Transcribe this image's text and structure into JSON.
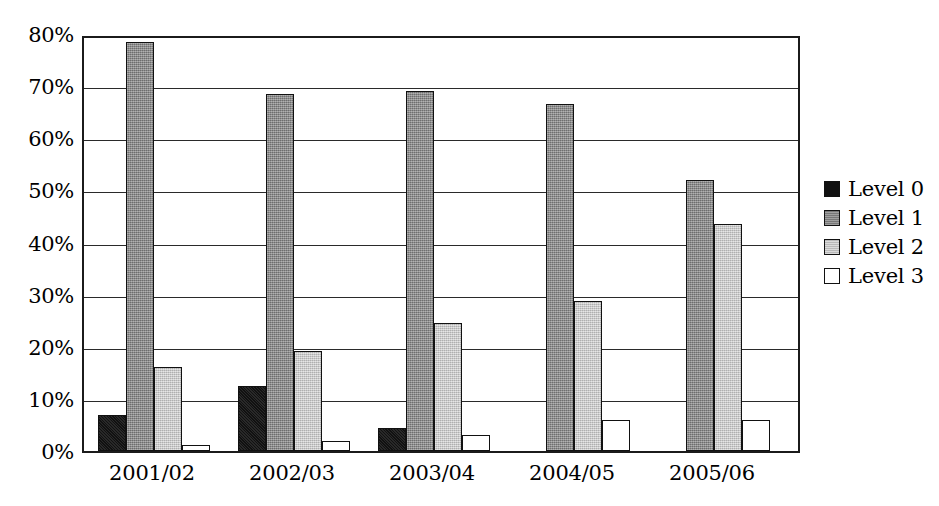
{
  "chart_data": {
    "type": "bar",
    "title": "",
    "subtitle": "",
    "xlabel": "",
    "ylabel": "",
    "categories": [
      "2001/02",
      "2002/03",
      "2003/04",
      "2004/05",
      "2005/06"
    ],
    "series": [
      {
        "name": "Level 0",
        "color": "#111111",
        "values": [
          7.0,
          12.5,
          4.5,
          0,
          0
        ]
      },
      {
        "name": "Level 1",
        "color": "#858585",
        "values": [
          78.5,
          68.5,
          69.0,
          66.5,
          52.0
        ]
      },
      {
        "name": "Level 2",
        "color": "#c6c6c6",
        "values": [
          16.2,
          19.2,
          24.5,
          28.8,
          43.5
        ]
      },
      {
        "name": "Level 3",
        "color": "#ffffff",
        "values": [
          1.2,
          2.0,
          3.0,
          6.0,
          6.0
        ]
      }
    ],
    "ylim": [
      0,
      80
    ],
    "ytick_values": [
      0,
      10,
      20,
      30,
      40,
      50,
      60,
      70,
      80
    ],
    "ytick_labels": [
      "0%",
      "10%",
      "20%",
      "30%",
      "40%",
      "50%",
      "60%",
      "70%",
      "80%"
    ],
    "grid": "horizontal",
    "legend_position": "right",
    "legend_entries": [
      "Level 0",
      "Level 1",
      "Level 2",
      "Level 3"
    ]
  }
}
